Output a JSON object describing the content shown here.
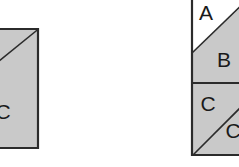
{
  "figure": {
    "canvas": {
      "width": 239,
      "height": 167
    },
    "colors": {
      "background": "#ffffff",
      "fill_gray": "#c9c9c9",
      "fill_white": "#ffffff",
      "stroke": "#2b2b2b",
      "label": "#1a1a1a"
    },
    "left_figure": {
      "name": "left-rectangle",
      "note": "rectangle cropped by the left edge of the image",
      "bounds": {
        "x": -18,
        "y": 28,
        "width": 57,
        "height": 121
      },
      "regions": [
        {
          "id": "left-upper-triangle",
          "label": "",
          "fill": "gray"
        },
        {
          "id": "left-lower-triangle",
          "label": "C",
          "fill": "gray"
        }
      ],
      "labels": [
        {
          "text": "C",
          "x": 3,
          "y": 113
        }
      ]
    },
    "right_figure": {
      "name": "right-rectangle",
      "note": "rectangle cropped by the top and right edges of the image",
      "bounds": {
        "x": 191,
        "y": -4,
        "width": 62,
        "height": 160
      },
      "divider_y": 83,
      "regions": [
        {
          "id": "region-a",
          "label": "A",
          "fill": "white"
        },
        {
          "id": "region-b",
          "label": "B",
          "fill": "gray"
        },
        {
          "id": "region-c-left",
          "label": "C",
          "fill": "gray"
        },
        {
          "id": "region-c-right",
          "label": "C",
          "fill": "gray"
        }
      ],
      "labels": [
        {
          "text": "A",
          "x": 206,
          "y": 14
        },
        {
          "text": "B",
          "x": 224,
          "y": 61
        },
        {
          "text": "C",
          "x": 208,
          "y": 105
        },
        {
          "text": "C",
          "x": 233,
          "y": 132
        }
      ]
    }
  }
}
